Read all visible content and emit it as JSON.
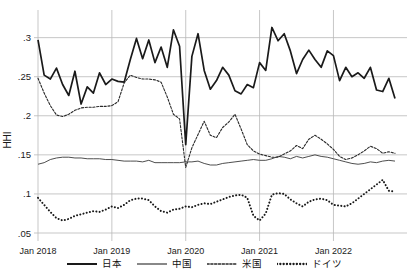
{
  "chart_data": {
    "type": "line",
    "title": "",
    "subtitle": "",
    "xlabel": "",
    "ylabel": "HHI",
    "ylim": [
      0.05,
      0.32
    ],
    "xlim": [
      "2018-01",
      "2022-11"
    ],
    "grid": true,
    "legend_position": "bottom",
    "ytick_labels": [
      ".05",
      ".1",
      ".15",
      ".2",
      ".25",
      ".3"
    ],
    "ytick_values": [
      0.05,
      0.1,
      0.15,
      0.2,
      0.25,
      0.3
    ],
    "xtick_labels": [
      "Jan 2018",
      "Jan 2019",
      "Jan 2020",
      "Jan 2021",
      "Jan 2022"
    ],
    "xtick_values": [
      "2018-01",
      "2019-01",
      "2020-01",
      "2021-01",
      "2022-01"
    ],
    "x": [
      "2018-01",
      "2018-02",
      "2018-03",
      "2018-04",
      "2018-05",
      "2018-06",
      "2018-07",
      "2018-08",
      "2018-09",
      "2018-10",
      "2018-11",
      "2018-12",
      "2019-01",
      "2019-02",
      "2019-03",
      "2019-04",
      "2019-05",
      "2019-06",
      "2019-07",
      "2019-08",
      "2019-09",
      "2019-10",
      "2019-11",
      "2019-12",
      "2020-01",
      "2020-02",
      "2020-03",
      "2020-04",
      "2020-05",
      "2020-06",
      "2020-07",
      "2020-08",
      "2020-09",
      "2020-10",
      "2020-11",
      "2020-12",
      "2021-01",
      "2021-02",
      "2021-03",
      "2021-04",
      "2021-05",
      "2021-06",
      "2021-07",
      "2021-08",
      "2021-09",
      "2021-10",
      "2021-11",
      "2021-12",
      "2022-01",
      "2022-02",
      "2022-03",
      "2022-04",
      "2022-05",
      "2022-06",
      "2022-07",
      "2022-08",
      "2022-09",
      "2022-10",
      "2022-11"
    ],
    "series": [
      {
        "name": "日本",
        "style": "thick-solid",
        "color": "#1a1a1a",
        "values": [
          0.297,
          0.252,
          0.247,
          0.261,
          0.24,
          0.226,
          0.257,
          0.215,
          0.237,
          0.229,
          0.255,
          0.24,
          0.247,
          0.244,
          0.243,
          0.272,
          0.299,
          0.273,
          0.297,
          0.268,
          0.288,
          0.262,
          0.31,
          0.289,
          0.163,
          0.276,
          0.305,
          0.258,
          0.234,
          0.245,
          0.262,
          0.252,
          0.232,
          0.228,
          0.24,
          0.236,
          0.268,
          0.258,
          0.313,
          0.296,
          0.305,
          0.283,
          0.254,
          0.272,
          0.284,
          0.272,
          0.262,
          0.283,
          0.277,
          0.245,
          0.262,
          0.25,
          0.255,
          0.248,
          0.262,
          0.233,
          0.231,
          0.248,
          0.222
        ]
      },
      {
        "name": "中国",
        "style": "thin-solid",
        "color": "#3a3a3a",
        "values": [
          0.138,
          0.14,
          0.144,
          0.146,
          0.147,
          0.147,
          0.146,
          0.146,
          0.145,
          0.145,
          0.145,
          0.144,
          0.144,
          0.143,
          0.142,
          0.142,
          0.142,
          0.141,
          0.143,
          0.14,
          0.14,
          0.14,
          0.14,
          0.14,
          0.141,
          0.141,
          0.142,
          0.139,
          0.137,
          0.137,
          0.139,
          0.14,
          0.141,
          0.142,
          0.143,
          0.144,
          0.143,
          0.143,
          0.145,
          0.148,
          0.147,
          0.145,
          0.148,
          0.146,
          0.148,
          0.15,
          0.148,
          0.147,
          0.145,
          0.143,
          0.141,
          0.139,
          0.138,
          0.139,
          0.141,
          0.14,
          0.142,
          0.143,
          0.142
        ]
      },
      {
        "name": "米国",
        "style": "fine-dotted",
        "color": "#2a2a2a",
        "values": [
          0.248,
          0.229,
          0.213,
          0.201,
          0.199,
          0.202,
          0.207,
          0.21,
          0.211,
          0.211,
          0.212,
          0.212,
          0.213,
          0.218,
          0.242,
          0.252,
          0.249,
          0.247,
          0.247,
          0.246,
          0.243,
          0.224,
          0.202,
          0.196,
          0.134,
          0.159,
          0.176,
          0.193,
          0.175,
          0.172,
          0.185,
          0.192,
          0.202,
          0.183,
          0.163,
          0.155,
          0.151,
          0.149,
          0.147,
          0.147,
          0.151,
          0.155,
          0.162,
          0.158,
          0.17,
          0.175,
          0.17,
          0.164,
          0.157,
          0.148,
          0.144,
          0.146,
          0.15,
          0.155,
          0.161,
          0.158,
          0.152,
          0.154,
          0.152
        ]
      },
      {
        "name": "ドイツ",
        "style": "bold-dotted",
        "color": "#1a1a1a",
        "values": [
          0.095,
          0.086,
          0.077,
          0.069,
          0.066,
          0.068,
          0.072,
          0.074,
          0.076,
          0.078,
          0.077,
          0.08,
          0.084,
          0.082,
          0.086,
          0.092,
          0.094,
          0.094,
          0.092,
          0.084,
          0.078,
          0.076,
          0.08,
          0.081,
          0.084,
          0.083,
          0.086,
          0.088,
          0.087,
          0.09,
          0.093,
          0.096,
          0.098,
          0.099,
          0.095,
          0.072,
          0.066,
          0.075,
          0.099,
          0.101,
          0.1,
          0.093,
          0.088,
          0.084,
          0.09,
          0.093,
          0.094,
          0.092,
          0.086,
          0.085,
          0.084,
          0.088,
          0.094,
          0.1,
          0.106,
          0.112,
          0.118,
          0.104,
          0.103
        ]
      }
    ]
  }
}
